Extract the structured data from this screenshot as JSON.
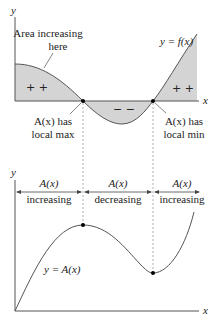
{
  "top_graph": {
    "y_axis_label": "y",
    "x_axis_label": "x",
    "curve_label": "y = f(x)",
    "annotation_area": [
      "Area increasing",
      "here"
    ],
    "positive_signs_left": "+ +",
    "negative_signs": "− −",
    "positive_signs_right": "+ +",
    "local_max_label": [
      "A(x) has",
      "local max"
    ],
    "local_min_label": [
      "A(x) has",
      "local min"
    ]
  },
  "intervals": [
    {
      "top": "A(x)",
      "bottom": "increasing"
    },
    {
      "top": "A(x)",
      "bottom": "decreasing"
    },
    {
      "top": "A(x)",
      "bottom": "increasing"
    }
  ],
  "bottom_graph": {
    "y_axis_label": "y",
    "x_axis_label": "x",
    "curve_label": "y = A(x)"
  },
  "colors": {
    "fill": "#d4d4d4",
    "curve": "#555555",
    "axis": "#555555",
    "dash": "#9a9a9a",
    "point": "#000000"
  }
}
